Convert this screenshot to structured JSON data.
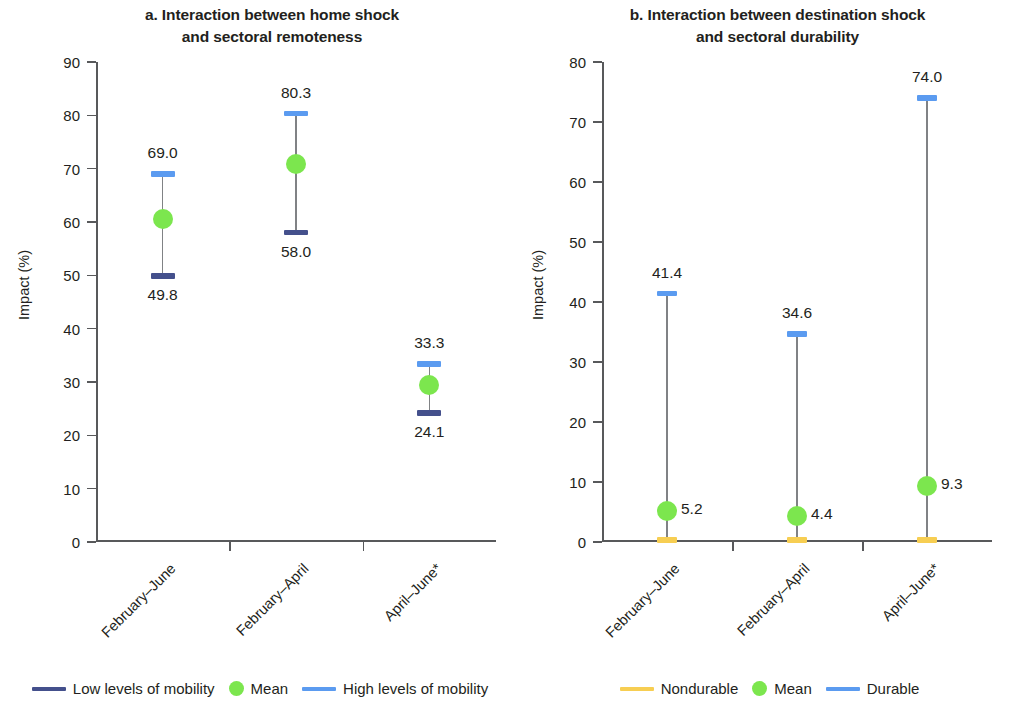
{
  "figure": {
    "ylabel": "Impact (%)"
  },
  "panels": [
    {
      "id": "panel-a",
      "title_line1": "a. Interaction between home shock",
      "title_line2": "and sectoral remoteness",
      "ylabel": "Impact (%)",
      "yticks": [
        "0",
        "10",
        "20",
        "30",
        "40",
        "50",
        "60",
        "70",
        "80",
        "90"
      ],
      "categories": [
        "February–June",
        "February–April",
        "April–June*"
      ],
      "points": [
        {
          "high_label": "69.0",
          "low_label": "49.8",
          "mean_label": ""
        },
        {
          "high_label": "80.3",
          "low_label": "58.0",
          "mean_label": ""
        },
        {
          "high_label": "33.3",
          "low_label": "24.1",
          "mean_label": ""
        }
      ],
      "legend": [
        {
          "type": "line",
          "color": "#44508c",
          "label": "Low levels of mobility"
        },
        {
          "type": "dot",
          "color": "#7ce64e",
          "label": "Mean"
        },
        {
          "type": "line",
          "color": "#5b9bf0",
          "label": "High levels of mobility"
        }
      ]
    },
    {
      "id": "panel-b",
      "title_line1": "b. Interaction between destination shock",
      "title_line2": "and sectoral durability",
      "ylabel": "Impact (%)",
      "yticks": [
        "0",
        "10",
        "20",
        "30",
        "40",
        "50",
        "60",
        "70",
        "80"
      ],
      "categories": [
        "February–June",
        "February–April",
        "April–June*"
      ],
      "points": [
        {
          "high_label": "41.4",
          "low_label": "",
          "mean_label": "5.2"
        },
        {
          "high_label": "34.6",
          "low_label": "",
          "mean_label": "4.4"
        },
        {
          "high_label": "74.0",
          "low_label": "",
          "mean_label": "9.3"
        }
      ],
      "legend": [
        {
          "type": "line",
          "color": "#f7ce52",
          "label": "Nondurable"
        },
        {
          "type": "dot",
          "color": "#7ce64e",
          "label": "Mean"
        },
        {
          "type": "line",
          "color": "#5b9bf0",
          "label": "Durable"
        }
      ]
    }
  ],
  "chart_data": [
    {
      "type": "line",
      "panel": "a",
      "title": "a. Interaction between home shock and sectoral remoteness",
      "xlabel": "",
      "ylabel": "Impact (%)",
      "ylim": [
        0,
        90
      ],
      "yticks": [
        0,
        10,
        20,
        30,
        40,
        50,
        60,
        70,
        80,
        90
      ],
      "grid": false,
      "legend_position": "bottom",
      "categories": [
        "February–June",
        "February–April",
        "April–June*"
      ],
      "series": [
        {
          "name": "Low levels of mobility",
          "color": "#44508c",
          "values": [
            49.8,
            58.0,
            24.1
          ]
        },
        {
          "name": "Mean",
          "color": "#7ce64e",
          "values": [
            60.6,
            70.8,
            29.5
          ]
        },
        {
          "name": "High levels of mobility",
          "color": "#5b9bf0",
          "values": [
            69.0,
            80.3,
            33.3
          ]
        }
      ],
      "annotations": [
        {
          "category": "February–June",
          "text": "69.0",
          "value": 69.0,
          "position": "above"
        },
        {
          "category": "February–June",
          "text": "49.8",
          "value": 49.8,
          "position": "below"
        },
        {
          "category": "February–April",
          "text": "80.3",
          "value": 80.3,
          "position": "above"
        },
        {
          "category": "February–April",
          "text": "58.0",
          "value": 58.0,
          "position": "below"
        },
        {
          "category": "April–June*",
          "text": "33.3",
          "value": 33.3,
          "position": "above"
        },
        {
          "category": "April–June*",
          "text": "24.1",
          "value": 24.1,
          "position": "below"
        }
      ]
    },
    {
      "type": "line",
      "panel": "b",
      "title": "b. Interaction between destination shock and sectoral durability",
      "xlabel": "",
      "ylabel": "Impact (%)",
      "ylim": [
        0,
        80
      ],
      "yticks": [
        0,
        10,
        20,
        30,
        40,
        50,
        60,
        70,
        80
      ],
      "grid": false,
      "legend_position": "bottom",
      "categories": [
        "February–June",
        "February–April",
        "April–June*"
      ],
      "series": [
        {
          "name": "Nondurable",
          "color": "#f7ce52",
          "values": [
            0.3,
            0.3,
            0.3
          ]
        },
        {
          "name": "Mean",
          "color": "#7ce64e",
          "values": [
            5.2,
            4.4,
            9.3
          ]
        },
        {
          "name": "Durable",
          "color": "#5b9bf0",
          "values": [
            41.4,
            34.6,
            74.0
          ]
        }
      ],
      "annotations": [
        {
          "category": "February–June",
          "text": "41.4",
          "value": 41.4,
          "position": "above"
        },
        {
          "category": "February–June",
          "text": "5.2",
          "value": 5.2,
          "position": "right"
        },
        {
          "category": "February–April",
          "text": "34.6",
          "value": 34.6,
          "position": "above"
        },
        {
          "category": "February–April",
          "text": "4.4",
          "value": 4.4,
          "position": "right"
        },
        {
          "category": "April–June*",
          "text": "74.0",
          "value": 74.0,
          "position": "above"
        },
        {
          "category": "April–June*",
          "text": "9.3",
          "value": 9.3,
          "position": "right"
        }
      ]
    }
  ]
}
